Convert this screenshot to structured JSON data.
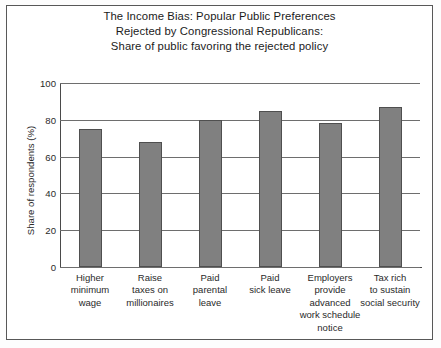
{
  "chart_data": {
    "type": "bar",
    "title": "The Income Bias: Popular Public Preferences Rejected by Congressional Republicans: Share of public favoring the rejected policy",
    "title_lines": [
      "The Income Bias: Popular Public Preferences",
      "Rejected by Congressional Republicans:",
      "Share of public favoring the rejected policy"
    ],
    "xlabel": "",
    "ylabel": "Share of respondents (%)",
    "ylim": [
      0,
      100
    ],
    "yticks": [
      100,
      80,
      60,
      40,
      20,
      0
    ],
    "grid": true,
    "legend": false,
    "bar_color": "#808080",
    "bar_edge_color": "#4f4f4f",
    "categories": [
      "Higher minimum wage",
      "Raise taxes on millionaires",
      "Paid parental leave",
      "Paid sick leave",
      "Employers provide advanced work schedule notice",
      "Tax rich to sustain social security"
    ],
    "category_lines": [
      [
        "Higher",
        "minimum",
        "wage"
      ],
      [
        "Raise",
        "taxes on",
        "millionaires"
      ],
      [
        "Paid",
        "parental",
        "leave"
      ],
      [
        "Paid",
        "sick leave"
      ],
      [
        "Employers",
        "provide",
        "advanced",
        "work schedule",
        "notice"
      ],
      [
        "Tax rich",
        "to sustain",
        "social security"
      ]
    ],
    "values": [
      75,
      68,
      80,
      85,
      78,
      87
    ]
  }
}
